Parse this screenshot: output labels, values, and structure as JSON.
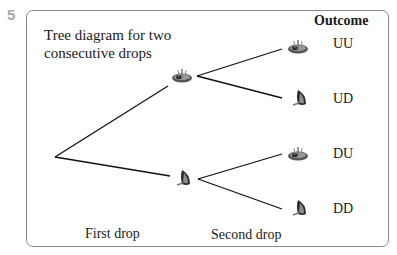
{
  "question_number": "5",
  "diagram": {
    "title_line1": "Tree diagram for two",
    "title_line2": "consecutive drops",
    "outcome_header": "Outcome",
    "first_stage": {
      "label": "First drop",
      "nodes": [
        {
          "name": "U",
          "icon": "thumbtack-up-icon"
        },
        {
          "name": "D",
          "icon": "thumbtack-down-icon"
        }
      ]
    },
    "second_stage": {
      "label": "Second drop"
    },
    "outcomes": [
      {
        "label": "UU",
        "icon": "thumbtack-up-icon"
      },
      {
        "label": "UD",
        "icon": "thumbtack-down-icon"
      },
      {
        "label": "DU",
        "icon": "thumbtack-up-icon"
      },
      {
        "label": "DD",
        "icon": "thumbtack-down-icon"
      }
    ]
  }
}
